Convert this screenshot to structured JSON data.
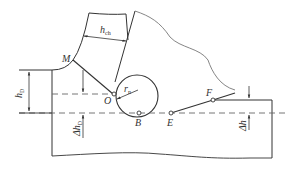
{
  "diagram": {
    "type": "cutting-tool-edge-geometry",
    "points": [
      {
        "id": "M",
        "label": "M"
      },
      {
        "id": "O",
        "label": "O"
      },
      {
        "id": "B",
        "label": "B"
      },
      {
        "id": "E",
        "label": "E"
      },
      {
        "id": "F",
        "label": "F"
      }
    ],
    "dimensions": {
      "chip_thickness": {
        "symbol": "h",
        "sub": "ch"
      },
      "cut_depth": {
        "symbol": "h",
        "sub": "D"
      },
      "delta_cut_depth": {
        "prefix": "Δ",
        "symbol": "h",
        "sub": "D"
      },
      "edge_radius": {
        "symbol": "r",
        "sub": "n"
      },
      "delta_h": {
        "prefix": "Δ",
        "symbol": "h"
      }
    },
    "colors": {
      "stroke": "#333333",
      "dashed": "#666666",
      "tool_outline": "#777777"
    }
  }
}
